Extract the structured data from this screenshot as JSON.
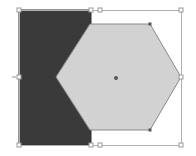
{
  "canvas": {
    "width": 196,
    "height": 156,
    "background": "#ffffff"
  },
  "shapes": {
    "rectangle": {
      "x": 19,
      "y": 10,
      "width": 72,
      "height": 135,
      "fill": "#3a3a3a",
      "stroke": "#2e2e2e"
    },
    "hexagon": {
      "points": "90,24 150,24 181,77 150,130 90,130 56,77",
      "fill": "#d2d2d2",
      "stroke": "#8a8a8a",
      "center": {
        "x": 116,
        "y": 78
      },
      "vertex_markers": [
        {
          "x": 150,
          "y": 24
        },
        {
          "x": 150,
          "y": 130
        }
      ]
    }
  },
  "selection": {
    "x": 19,
    "y": 10,
    "width": 162,
    "height": 135,
    "stroke": "#b0b0b0",
    "handles": [
      {
        "x": 19,
        "y": 10
      },
      {
        "x": 91,
        "y": 10
      },
      {
        "x": 100,
        "y": 10
      },
      {
        "x": 181,
        "y": 10
      },
      {
        "x": 19,
        "y": 77
      },
      {
        "x": 181,
        "y": 77
      },
      {
        "x": 19,
        "y": 145
      },
      {
        "x": 91,
        "y": 145
      },
      {
        "x": 100,
        "y": 145
      },
      {
        "x": 181,
        "y": 145
      }
    ]
  }
}
